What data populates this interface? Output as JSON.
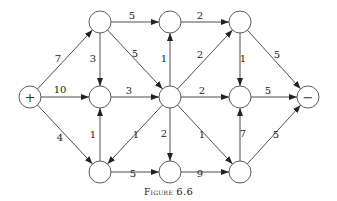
{
  "caption": {
    "prefix": "Figure",
    "number": "6.6"
  },
  "colors": {
    "stroke": "#222222",
    "node_fill": "#ffffff",
    "background": "#ffffff"
  },
  "diagram": {
    "type": "directed network flow graph",
    "nodes": [
      {
        "id": "source",
        "label": "+",
        "x": 30,
        "y": 97
      },
      {
        "id": "a",
        "label": "",
        "x": 100,
        "y": 22
      },
      {
        "id": "b",
        "label": "",
        "x": 170,
        "y": 22
      },
      {
        "id": "c",
        "label": "",
        "x": 240,
        "y": 22
      },
      {
        "id": "d",
        "label": "",
        "x": 100,
        "y": 97
      },
      {
        "id": "e",
        "label": "",
        "x": 170,
        "y": 97
      },
      {
        "id": "f",
        "label": "",
        "x": 240,
        "y": 97
      },
      {
        "id": "sink",
        "label": "−",
        "x": 308,
        "y": 97
      },
      {
        "id": "g",
        "label": "",
        "x": 100,
        "y": 172
      },
      {
        "id": "h",
        "label": "",
        "x": 170,
        "y": 172
      },
      {
        "id": "i",
        "label": "",
        "x": 240,
        "y": 172
      }
    ],
    "edges": [
      {
        "from": "source",
        "to": "a",
        "weight": "7",
        "lx": 58,
        "ly": 62
      },
      {
        "from": "source",
        "to": "d",
        "weight": "10",
        "lx": 60,
        "ly": 93
      },
      {
        "from": "source",
        "to": "g",
        "weight": "4",
        "lx": 60,
        "ly": 141
      },
      {
        "from": "a",
        "to": "b",
        "weight": "5",
        "lx": 132,
        "ly": 19
      },
      {
        "from": "a",
        "to": "d",
        "weight": "3",
        "lx": 93,
        "ly": 62
      },
      {
        "from": "a",
        "to": "e",
        "weight": "5",
        "lx": 135,
        "ly": 57
      },
      {
        "from": "d",
        "to": "e",
        "weight": "3",
        "lx": 129,
        "ly": 94
      },
      {
        "from": "g",
        "to": "d",
        "weight": "1",
        "lx": 93,
        "ly": 138
      },
      {
        "from": "e",
        "to": "g",
        "weight": "1",
        "lx": 136,
        "ly": 138
      },
      {
        "from": "g",
        "to": "h",
        "weight": "5",
        "lx": 133,
        "ly": 177
      },
      {
        "from": "e",
        "to": "b",
        "weight": "1",
        "lx": 164,
        "ly": 62
      },
      {
        "from": "b",
        "to": "c",
        "weight": "2",
        "lx": 200,
        "ly": 19
      },
      {
        "from": "e",
        "to": "c",
        "weight": "2",
        "lx": 200,
        "ly": 58
      },
      {
        "from": "e",
        "to": "f",
        "weight": "2",
        "lx": 202,
        "ly": 94
      },
      {
        "from": "e",
        "to": "h",
        "weight": "2",
        "lx": 164,
        "ly": 137
      },
      {
        "from": "e",
        "to": "i",
        "weight": "1",
        "lx": 202,
        "ly": 138
      },
      {
        "from": "c",
        "to": "f",
        "weight": "1",
        "lx": 243,
        "ly": 62
      },
      {
        "from": "c",
        "to": "sink",
        "weight": "5",
        "lx": 277,
        "ly": 58
      },
      {
        "from": "f",
        "to": "sink",
        "weight": "5",
        "lx": 268,
        "ly": 94
      },
      {
        "from": "i",
        "to": "f",
        "weight": "7",
        "lx": 243,
        "ly": 137
      },
      {
        "from": "h",
        "to": "i",
        "weight": "9",
        "lx": 200,
        "ly": 177
      },
      {
        "from": "i",
        "to": "sink",
        "weight": "5",
        "lx": 276,
        "ly": 138
      }
    ]
  }
}
